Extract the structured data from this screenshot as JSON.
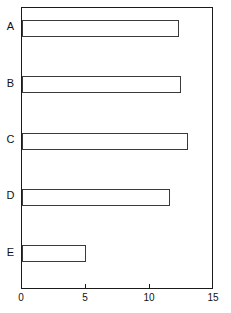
{
  "chart_data": {
    "type": "bar",
    "orientation": "horizontal",
    "title": "",
    "subtitle": "",
    "xlabel": "",
    "ylabel": "",
    "categories": [
      "A",
      "B",
      "C",
      "D",
      "E"
    ],
    "values": [
      12.3,
      12.4,
      13.0,
      11.6,
      5.0
    ],
    "series": [
      {
        "name": "",
        "values": [
          12.3,
          12.4,
          13.0,
          11.6,
          5.0
        ]
      }
    ],
    "xlim": [
      0,
      15
    ],
    "xticks": [
      0,
      5,
      10,
      15
    ],
    "xtick_labels": [
      "0",
      "5",
      "10",
      "15"
    ],
    "ytick_labels": [
      "A",
      "B",
      "C",
      "D",
      "E"
    ],
    "grid": false,
    "legend": false,
    "legend_position": "none",
    "bar_facecolor": "#ffffff",
    "bar_edgecolor": "#3a3a3a",
    "axis_color": "#1a1a1a",
    "background_color": "#ffffff",
    "annotations": []
  },
  "axes": {
    "x_axis_name": "x-axis",
    "y_axis_name": "y-axis"
  }
}
